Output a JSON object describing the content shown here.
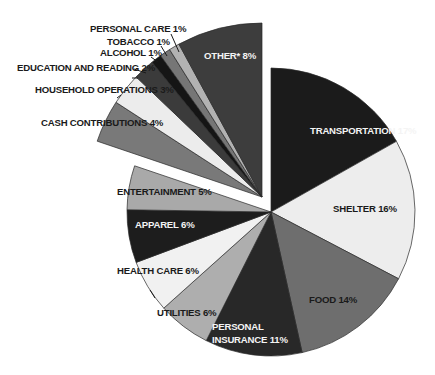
{
  "chart_data": {
    "type": "pie",
    "title": "",
    "unit": "%",
    "start_angle_deg": 0,
    "direction": "clockwise",
    "exploded_group": [
      "Cash Contributions",
      "Household Operations",
      "Education and Reading",
      "Alcohol",
      "Tobacco",
      "Personal Care",
      "Other*"
    ],
    "slices": [
      {
        "label": "TRANSPORTATION 17%",
        "name": "Transportation",
        "value": 17,
        "color": "#1b1b1b",
        "exploded": false,
        "text_color": "light",
        "lx": 310,
        "ly": 134
      },
      {
        "label": "SHELTER 16%",
        "name": "Shelter",
        "value": 16,
        "color": "#ededed",
        "exploded": false,
        "text_color": "dark",
        "lx": 333,
        "ly": 212
      },
      {
        "label": "FOOD 14%",
        "name": "Food",
        "value": 14,
        "color": "#6e6e6e",
        "exploded": false,
        "text_color": "dark",
        "lx": 309,
        "ly": 303
      },
      {
        "label": "PERSONAL",
        "label2": "INSURANCE 11%",
        "name": "Personal Insurance",
        "value": 11,
        "color": "#282828",
        "exploded": false,
        "text_color": "light",
        "lx": 212,
        "ly": 330
      },
      {
        "label": "UTILITIES 6%",
        "name": "Utilities",
        "value": 6,
        "color": "#aeaeae",
        "exploded": false,
        "text_color": "dark",
        "lx": 157,
        "ly": 316
      },
      {
        "label": "HEALTH CARE 6%",
        "name": "Health Care",
        "value": 6,
        "color": "#f1f1f1",
        "exploded": false,
        "text_color": "dark",
        "lx": 117,
        "ly": 274
      },
      {
        "label": "APPAREL 6%",
        "name": "Apparel",
        "value": 6,
        "color": "#1d1d1d",
        "exploded": false,
        "text_color": "light",
        "lx": 135,
        "ly": 228
      },
      {
        "label": "ENTERTAINMENT 5%",
        "name": "Entertainment",
        "value": 5,
        "color": "#a9a9a9",
        "exploded": false,
        "text_color": "dark",
        "lx": 117,
        "ly": 195
      },
      {
        "label": "CASH CONTRIBUTIONS 4%",
        "name": "Cash Contributions",
        "value": 4,
        "color": "#797979",
        "exploded": true,
        "text_color": "dark",
        "lx": 41,
        "ly": 126
      },
      {
        "label": "HOUSEHOLD OPERATIONS 3%",
        "name": "Household Operations",
        "value": 3,
        "color": "#ececec",
        "exploded": true,
        "text_color": "dark",
        "lx": 35,
        "ly": 93
      },
      {
        "label": "EDUCATION AND READING 2%",
        "name": "Education and Reading",
        "value": 2,
        "color": "#3b3b3b",
        "exploded": true,
        "text_color": "dark",
        "lx": 17,
        "ly": 71
      },
      {
        "label": "ALCOHOL 1%",
        "name": "Alcohol",
        "value": 1,
        "color": "#151515",
        "exploded": true,
        "text_color": "dark",
        "lx": 100,
        "ly": 56
      },
      {
        "label": "TOBACCO 1%",
        "name": "Tobacco",
        "value": 1,
        "color": "#767676",
        "exploded": true,
        "text_color": "dark",
        "lx": 107,
        "ly": 45
      },
      {
        "label": "PERSONAL CARE 1%",
        "name": "Personal Care",
        "value": 1,
        "color": "#b2b2b2",
        "exploded": true,
        "text_color": "dark",
        "lx": 90,
        "ly": 32
      },
      {
        "label": "OTHER* 8%",
        "name": "Other*",
        "value": 8,
        "color": "#3d3d3d",
        "exploded": true,
        "text_color": "light",
        "lx": 204,
        "ly": 59
      }
    ],
    "leaders": [
      {
        "for": "Personal Care",
        "x1": 171,
        "y1": 34,
        "x2": 179,
        "y2": 52
      },
      {
        "for": "Tobacco",
        "x1": 161,
        "y1": 46,
        "x2": 167,
        "y2": 56
      },
      {
        "for": "Alcohol",
        "x1": 151,
        "y1": 57,
        "x2": 158,
        "y2": 62
      },
      {
        "for": "Education and Reading",
        "x1": 134,
        "y1": 69,
        "x2": 146,
        "y2": 73
      },
      {
        "for": "Education and Reading 2",
        "x1": 138,
        "y1": 78,
        "x2": 132,
        "y2": 78
      },
      {
        "for": "Household Operations",
        "x1": 117,
        "y1": 98,
        "x2": 121,
        "y2": 95
      },
      {
        "for": "Health Care",
        "x1": 150,
        "y1": 290,
        "x2": 155,
        "y2": 298
      }
    ],
    "geometry": {
      "main_center": [
        271,
        212
      ],
      "main_radius": 144,
      "exploded_center": [
        262,
        197
      ],
      "exploded_radius": 174
    },
    "legend": "none (direct labels)",
    "grid": false
  }
}
